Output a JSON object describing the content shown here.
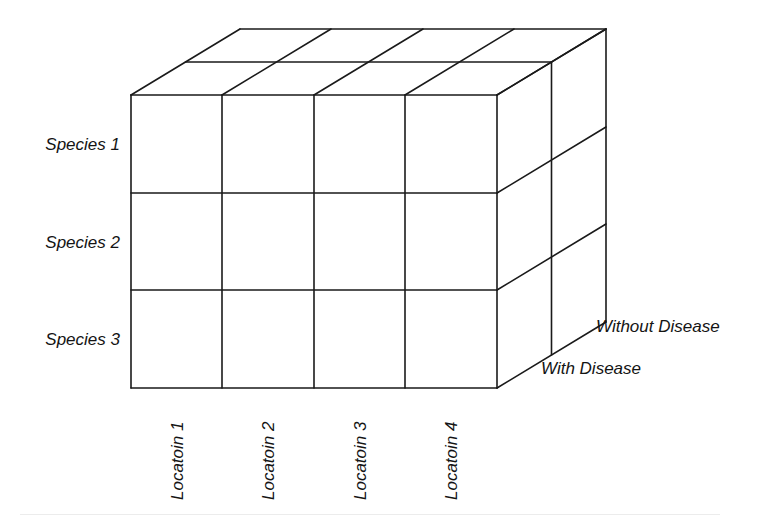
{
  "diagram": {
    "type": "3d-data-cube",
    "line_color": "#1a1a1a",
    "background": "#ffffff",
    "rows": {
      "dimension": "Species",
      "labels": [
        "Species 1",
        "Species 2",
        "Species 3"
      ]
    },
    "columns": {
      "dimension": "Location",
      "labels": [
        "Locatoin 1",
        "Locatoin 2",
        "Locatoin 3",
        "Locatoin 4"
      ]
    },
    "depth": {
      "dimension": "Disease status",
      "labels": [
        "With Disease",
        "Without Disease"
      ]
    },
    "geometry": {
      "front_x": [
        131,
        222,
        314,
        405,
        497
      ],
      "front_y": [
        95,
        193,
        290,
        388
      ],
      "depth_offset_x": 109,
      "depth_offset_y": -66,
      "depth_layers": 2
    }
  }
}
